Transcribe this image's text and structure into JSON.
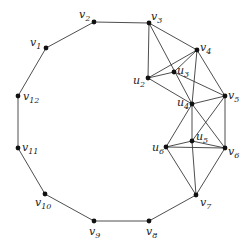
{
  "diagram": {
    "type": "graph",
    "vertices": [
      {
        "id": "v1",
        "label": "v",
        "sub": "1",
        "x": 46,
        "y": 48,
        "lx": 30,
        "ly": 46
      },
      {
        "id": "v2",
        "label": "v",
        "sub": "2",
        "x": 94,
        "y": 22,
        "lx": 79,
        "ly": 18
      },
      {
        "id": "v3",
        "label": "v",
        "sub": "3",
        "x": 149,
        "y": 23,
        "lx": 151,
        "ly": 20
      },
      {
        "id": "v4",
        "label": "v",
        "sub": "4",
        "x": 197,
        "y": 50,
        "lx": 200,
        "ly": 51
      },
      {
        "id": "v5",
        "label": "v",
        "sub": "5",
        "x": 225,
        "y": 96,
        "lx": 228,
        "ly": 99
      },
      {
        "id": "v6",
        "label": "v",
        "sub": "6",
        "x": 225,
        "y": 148,
        "lx": 228,
        "ly": 155
      },
      {
        "id": "v7",
        "label": "v",
        "sub": "7",
        "x": 196,
        "y": 195,
        "lx": 200,
        "ly": 206
      },
      {
        "id": "v8",
        "label": "v",
        "sub": "8",
        "x": 149,
        "y": 221,
        "lx": 146,
        "ly": 235
      },
      {
        "id": "v9",
        "label": "v",
        "sub": "9",
        "x": 94,
        "y": 221,
        "lx": 89,
        "ly": 235
      },
      {
        "id": "v10",
        "label": "v",
        "sub": "10",
        "x": 45,
        "y": 194,
        "lx": 35,
        "ly": 206
      },
      {
        "id": "v11",
        "label": "v",
        "sub": "11",
        "x": 18,
        "y": 148,
        "lx": 22,
        "ly": 151
      },
      {
        "id": "v12",
        "label": "v",
        "sub": "12",
        "x": 18,
        "y": 96,
        "lx": 23,
        "ly": 100
      },
      {
        "id": "u2",
        "label": "u",
        "sub": "2",
        "x": 148,
        "y": 78,
        "lx": 133,
        "ly": 84
      },
      {
        "id": "u3",
        "label": "u",
        "sub": "3",
        "x": 174,
        "y": 72,
        "lx": 177,
        "ly": 74
      },
      {
        "id": "u4",
        "label": "u",
        "sub": "4",
        "x": 192,
        "y": 104,
        "lx": 177,
        "ly": 106
      },
      {
        "id": "u5",
        "label": "u",
        "sub": "5",
        "x": 192,
        "y": 141,
        "lx": 196,
        "ly": 140
      },
      {
        "id": "u6",
        "label": "u",
        "sub": "6",
        "x": 166,
        "y": 147,
        "lx": 152,
        "ly": 151
      }
    ],
    "edges": [
      [
        "v1",
        "v2"
      ],
      [
        "v2",
        "v3"
      ],
      [
        "v3",
        "v4"
      ],
      [
        "v4",
        "v5"
      ],
      [
        "v5",
        "v6"
      ],
      [
        "v6",
        "v7"
      ],
      [
        "v7",
        "v8"
      ],
      [
        "v8",
        "v9"
      ],
      [
        "v9",
        "v10"
      ],
      [
        "v10",
        "v11"
      ],
      [
        "v11",
        "v12"
      ],
      [
        "v12",
        "v1"
      ],
      [
        "v3",
        "u2"
      ],
      [
        "v3",
        "u4"
      ],
      [
        "u2",
        "v4"
      ],
      [
        "u2",
        "u3"
      ],
      [
        "u3",
        "v4"
      ],
      [
        "u3",
        "v5"
      ],
      [
        "u2",
        "u4"
      ],
      [
        "v4",
        "u4"
      ],
      [
        "u4",
        "v5"
      ],
      [
        "u4",
        "u5"
      ],
      [
        "u4",
        "v6"
      ],
      [
        "u4",
        "u6"
      ],
      [
        "v5",
        "u5"
      ],
      [
        "u6",
        "u5"
      ],
      [
        "u5",
        "v6"
      ],
      [
        "u6",
        "v6"
      ],
      [
        "u6",
        "v7"
      ],
      [
        "u5",
        "v7"
      ]
    ]
  }
}
